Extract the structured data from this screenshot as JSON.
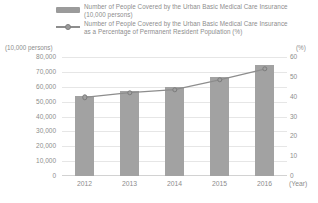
{
  "legend": {
    "series": [
      {
        "key": "bar-swatch",
        "line1": "Number of People Covered by the Urban Basic Medical Care Insurance",
        "line2": "(10,000 persons)"
      },
      {
        "key": "line-marker",
        "line1": "Number of People Covered by the Urban Basic Medical Care Insurance",
        "line2": "as a Percentage of Permanent Resident Population (%)"
      }
    ]
  },
  "axis": {
    "left_unit": "(10,000 persons)",
    "right_unit": "(%)",
    "x_unit": "(Year)",
    "left_ticks": [
      "80,000",
      "70,000",
      "60,000",
      "50,000",
      "40,000",
      "30,000",
      "20,000",
      "10,000",
      "0"
    ],
    "right_ticks": [
      "60",
      "50",
      "40",
      "30",
      "20",
      "10",
      "0"
    ]
  },
  "colors": {
    "bar": "#a2a2a2",
    "line": "#8d8d8d",
    "grid": "#e6e6e6",
    "text": "#8d8d8d",
    "background": "#ffffff"
  },
  "chart_data": {
    "type": "bar",
    "title": "",
    "subtitle": "",
    "categories": [
      "2012",
      "2013",
      "2014",
      "2015",
      "2016"
    ],
    "xlabel": "(Year)",
    "ylabel": "(10,000 persons)",
    "y2label": "(%)",
    "ylim": [
      0,
      80000
    ],
    "y2lim": [
      0,
      60
    ],
    "grid": true,
    "legend_position": "top",
    "series": [
      {
        "name": "Number of People Covered by the Urban Basic Medical Care Insurance (10,000 persons)",
        "type": "bar",
        "axis": "left",
        "values": [
          53600,
          57100,
          59700,
          66600,
          74400
        ]
      },
      {
        "name": "Number of People Covered by the Urban Basic Medical Care Insurance as a Percentage of Permanent Resident Population (%)",
        "type": "line",
        "axis": "right",
        "marker": "circle",
        "values": [
          39.6,
          42.0,
          43.6,
          48.5,
          53.9
        ]
      }
    ]
  }
}
